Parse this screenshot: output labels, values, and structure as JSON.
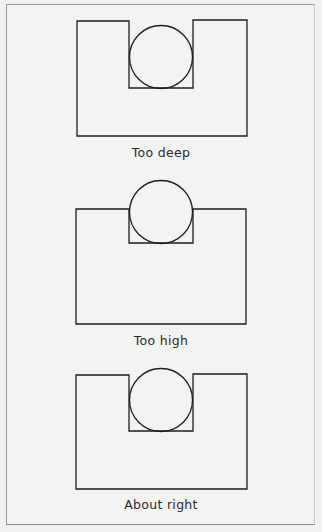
{
  "figures": [
    {
      "label": "Too deep",
      "outer": {
        "left": 77,
        "right": 247,
        "top": 21,
        "bottom": 136
      },
      "slot": {
        "left": 129,
        "right": 193,
        "bottom": 88
      },
      "circle": {
        "cx": 161,
        "cy": 57,
        "r": 31
      },
      "label_top": 145
    },
    {
      "label": "Too high",
      "outer": {
        "left": 76,
        "right": 246,
        "top": 209,
        "bottom": 324
      },
      "slot": {
        "left": 129,
        "right": 193,
        "bottom": 243
      },
      "circle": {
        "cx": 161,
        "cy": 212,
        "r": 31
      },
      "label_top": 333
    },
    {
      "label": "About right",
      "outer": {
        "left": 76,
        "right": 247,
        "top": 374,
        "bottom": 489
      },
      "slot": {
        "left": 129,
        "right": 193,
        "bottom": 431
      },
      "circle": {
        "cx": 161,
        "cy": 400,
        "r": 31
      },
      "label_top": 497
    }
  ],
  "colors": {
    "line": "#1e1e1e",
    "background": "#f3f3f3"
  }
}
